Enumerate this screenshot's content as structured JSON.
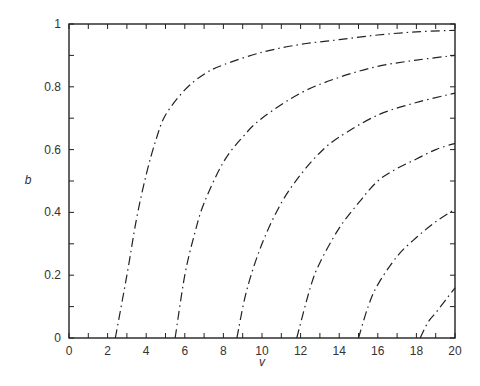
{
  "chart_data": {
    "type": "line",
    "title": "",
    "xlabel": "v",
    "ylabel": "b",
    "xlim": [
      0,
      20
    ],
    "ylim": [
      0,
      1
    ],
    "grid": false,
    "legend": null,
    "x_ticks": [
      0,
      2,
      4,
      6,
      8,
      10,
      12,
      14,
      16,
      18,
      20
    ],
    "y_ticks": [
      0,
      0.2,
      0.4,
      0.6,
      0.8,
      1
    ],
    "x_tick_labels": [
      "0",
      "2",
      "4",
      "6",
      "8",
      "10",
      "12",
      "14",
      "16",
      "18",
      "20"
    ],
    "y_tick_labels": [
      "0",
      "0.2",
      "0.4",
      "0.6",
      "0.8",
      "1"
    ],
    "line_style": "dash-dot",
    "series": [
      {
        "name": "curve-1",
        "points": [
          [
            2.4,
            0
          ],
          [
            3,
            0.2
          ],
          [
            3.5,
            0.38
          ],
          [
            4,
            0.52
          ],
          [
            4.5,
            0.63
          ],
          [
            5,
            0.71
          ],
          [
            6,
            0.79
          ],
          [
            7,
            0.84
          ],
          [
            8,
            0.87
          ],
          [
            10,
            0.91
          ],
          [
            12,
            0.935
          ],
          [
            14,
            0.95
          ],
          [
            16,
            0.965
          ],
          [
            18,
            0.975
          ],
          [
            20,
            0.98
          ]
        ]
      },
      {
        "name": "curve-2",
        "points": [
          [
            5.5,
            0
          ],
          [
            6,
            0.2
          ],
          [
            6.5,
            0.33
          ],
          [
            7,
            0.43
          ],
          [
            8,
            0.56
          ],
          [
            9,
            0.64
          ],
          [
            10,
            0.7
          ],
          [
            12,
            0.78
          ],
          [
            14,
            0.83
          ],
          [
            16,
            0.865
          ],
          [
            18,
            0.885
          ],
          [
            20,
            0.9
          ]
        ]
      },
      {
        "name": "curve-3",
        "points": [
          [
            8.7,
            0
          ],
          [
            9.2,
            0.15
          ],
          [
            10,
            0.3
          ],
          [
            11,
            0.43
          ],
          [
            12,
            0.52
          ],
          [
            13,
            0.59
          ],
          [
            14,
            0.64
          ],
          [
            16,
            0.71
          ],
          [
            18,
            0.75
          ],
          [
            20,
            0.78
          ]
        ]
      },
      {
        "name": "curve-4",
        "points": [
          [
            11.8,
            0
          ],
          [
            12.5,
            0.16
          ],
          [
            13,
            0.24
          ],
          [
            14,
            0.35
          ],
          [
            15,
            0.43
          ],
          [
            16,
            0.5
          ],
          [
            17,
            0.54
          ],
          [
            18,
            0.57
          ],
          [
            19,
            0.6
          ],
          [
            20,
            0.62
          ]
        ]
      },
      {
        "name": "curve-5",
        "points": [
          [
            15,
            0
          ],
          [
            15.5,
            0.1
          ],
          [
            16,
            0.17
          ],
          [
            17,
            0.26
          ],
          [
            18,
            0.32
          ],
          [
            19,
            0.37
          ],
          [
            20,
            0.41
          ]
        ]
      },
      {
        "name": "curve-6",
        "points": [
          [
            18.2,
            0
          ],
          [
            18.6,
            0.05
          ],
          [
            19,
            0.08
          ],
          [
            19.5,
            0.12
          ],
          [
            20,
            0.16
          ]
        ]
      }
    ]
  }
}
